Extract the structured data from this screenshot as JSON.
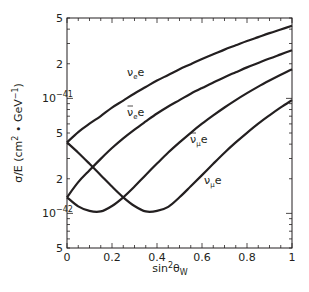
{
  "chart_data": {
    "type": "line",
    "title": "",
    "xlabel": "sin²θ_W",
    "ylabel": "σ/E (cm² · GeV⁻¹)",
    "xlim": [
      0,
      1
    ],
    "ylim": [
      5e-43,
      5e-41
    ],
    "yscale": "log",
    "grid": false,
    "legend": "inline labels",
    "x_ticks": [
      0,
      0.2,
      0.4,
      0.6,
      0.8,
      1
    ],
    "x_tick_labels": [
      "0",
      "0.2",
      "0.4",
      "0.6",
      "0.8",
      "1"
    ],
    "y_tick_labels": [
      {
        "value": 5e-41,
        "label": "5"
      },
      {
        "value": 2e-41,
        "label": "2"
      },
      {
        "value": 1e-41,
        "label": "10",
        "exp": "−41"
      },
      {
        "value": 5e-42,
        "label": "5"
      },
      {
        "value": 2e-42,
        "label": "2"
      },
      {
        "value": 1e-42,
        "label": "10",
        "exp": "−42"
      },
      {
        "value": 5e-43,
        "label": "5"
      }
    ],
    "y_unit": 1e-41,
    "x": [
      0,
      0.05,
      0.1,
      0.15,
      0.2,
      0.25,
      0.3,
      0.35,
      0.4,
      0.45,
      0.5,
      0.55,
      0.6,
      0.65,
      0.7,
      0.75,
      0.8,
      0.85,
      0.9,
      0.95,
      1
    ],
    "series": [
      {
        "name": "νe e",
        "label_main": "ν",
        "label_sub": "e",
        "label_tail": "e",
        "bar": false,
        "label_pos": [
          127,
          76
        ],
        "values": [
          0.414,
          0.509,
          0.602,
          0.702,
          0.831,
          0.957,
          1.104,
          1.256,
          1.428,
          1.598,
          1.794,
          1.985,
          2.202,
          2.416,
          2.655,
          2.892,
          3.152,
          3.411,
          3.692,
          3.974,
          4.278
        ]
      },
      {
        "name": "ν̄e e",
        "label_main": "ν",
        "label_sub": "e",
        "label_tail": "e",
        "bar": true,
        "label_pos": [
          127,
          116
        ],
        "values": [
          0.138,
          0.187,
          0.237,
          0.298,
          0.37,
          0.449,
          0.535,
          0.63,
          0.739,
          0.851,
          0.966,
          1.097,
          1.231,
          1.374,
          1.53,
          1.687,
          1.86,
          2.034,
          2.222,
          2.414,
          2.622
        ]
      },
      {
        "name": "ν̄μ e",
        "label_main": "ν",
        "label_sub": "μ",
        "label_tail": "e",
        "bar": true,
        "label_pos": [
          190,
          143
        ],
        "values": [
          0.138,
          0.115,
          0.105,
          0.104,
          0.116,
          0.138,
          0.171,
          0.216,
          0.271,
          0.338,
          0.414,
          0.502,
          0.602,
          0.711,
          0.833,
          0.966,
          1.11,
          1.266,
          1.43,
          1.607,
          1.794
        ]
      },
      {
        "name": "νμ e",
        "label_main": "ν",
        "label_sub": "μ",
        "label_tail": "e",
        "bar": false,
        "label_pos": [
          204,
          184
        ],
        "values": [
          0.414,
          0.337,
          0.27,
          0.215,
          0.171,
          0.138,
          0.116,
          0.104,
          0.105,
          0.114,
          0.138,
          0.172,
          0.215,
          0.27,
          0.337,
          0.414,
          0.502,
          0.603,
          0.712,
          0.834,
          0.966
        ]
      }
    ]
  },
  "layout": {
    "plot_left": 67,
    "plot_right": 292,
    "plot_top": 18,
    "plot_bottom": 248,
    "line_color": "#231f20"
  }
}
